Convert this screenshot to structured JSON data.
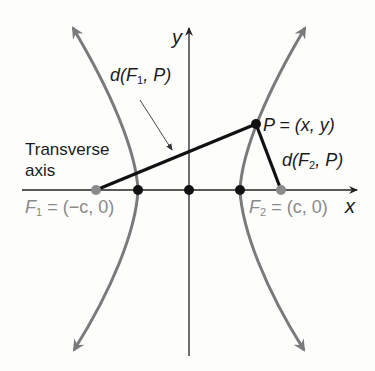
{
  "figure": {
    "type": "hyperbola-diagram",
    "colors": {
      "curve": "#7a7a7a",
      "axis": "#222222",
      "segment": "#111111",
      "focus": "#8a8a8a",
      "vertex": "#111111",
      "label_dark": "#1b1b1b",
      "label_gray": "#8a8a8a"
    },
    "axes": {
      "x_label": "x",
      "y_label": "y"
    },
    "labels": {
      "transverse_line1": "Transverse",
      "transverse_line2": "axis",
      "d_f1_p_prefix": "d(F",
      "d_f1_p_sub": "1",
      "d_f1_p_suffix": ", P)",
      "d_f2_p_prefix": "d(F",
      "d_f2_p_sub": "2",
      "d_f2_p_suffix": ", P)",
      "p_point": "P = (x, y)",
      "f1_prefix": "F",
      "f1_sub": "1",
      "f1_suffix": " = (−c, 0)",
      "f2_prefix": "F",
      "f2_sub": "2",
      "f2_suffix": " = (c, 0)"
    },
    "points": [
      {
        "name": "F1",
        "coords": "(-c, 0)"
      },
      {
        "name": "V1",
        "coords": "(-a, 0)"
      },
      {
        "name": "O",
        "coords": "(0, 0)"
      },
      {
        "name": "V2",
        "coords": "(a, 0)"
      },
      {
        "name": "F2",
        "coords": "(c, 0)"
      },
      {
        "name": "P",
        "coords": "(x, y)"
      }
    ]
  }
}
